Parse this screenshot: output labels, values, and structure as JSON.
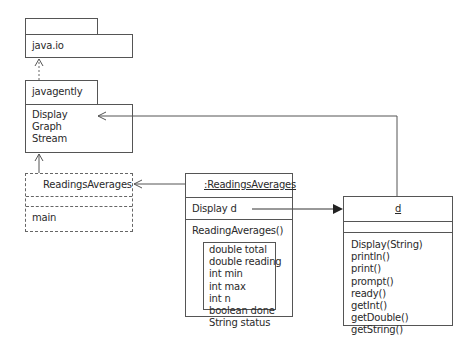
{
  "packages": {
    "java_io": {
      "name": "java.io"
    },
    "javagently": {
      "name": "javagently",
      "classes": [
        "Display",
        "Graph",
        "Stream"
      ]
    }
  },
  "class_readings_averages": {
    "name": "ReadingsAverages",
    "attributes": [],
    "operations": [
      "main"
    ]
  },
  "object_readings_averages": {
    "name": ":ReadingsAverages",
    "attributes": [
      "Display d"
    ],
    "operations": [
      "ReadingAverages()"
    ],
    "locals": [
      "double total",
      "double reading",
      "int min",
      "int max",
      "int n",
      "boolean done",
      "String status"
    ]
  },
  "object_d": {
    "name": "d",
    "attributes": [],
    "operations": [
      "Display(String)",
      "println()",
      "print()",
      "prompt()",
      "ready()",
      "getInt()",
      "getDouble()",
      "getString()"
    ]
  },
  "relationships": [
    {
      "from": "javagently",
      "to": "java.io",
      "type": "dependency"
    },
    {
      "from": "ReadingsAverages",
      "to": "javagently",
      "type": "dependency"
    },
    {
      "from": ":ReadingsAverages",
      "to": "ReadingsAverages",
      "type": "instance-of"
    },
    {
      "from": "Display d",
      "to": "d",
      "type": "reference"
    },
    {
      "from": "d",
      "to": "Display",
      "type": "instance-of"
    }
  ]
}
